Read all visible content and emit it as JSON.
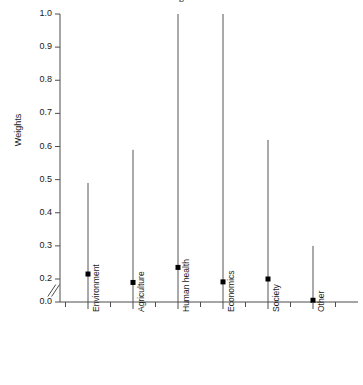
{
  "chart_data": {
    "type": "scatter",
    "title": "b",
    "xlabel": "",
    "ylabel": "Weights",
    "ylim": [
      0.0,
      1.0
    ],
    "grid": false,
    "legend": null,
    "axis_break": {
      "present": true,
      "symbol": "//",
      "between": [
        0.0,
        0.2
      ],
      "note": "double-slash break mark on y axis just above 0.0"
    },
    "yticks": [
      "0.0",
      "0.2",
      "0.3",
      "0.4",
      "0.5",
      "0.6",
      "0.7",
      "0.8",
      "0.9",
      "1.0"
    ],
    "ytick_values": [
      0.0,
      0.2,
      0.3,
      0.4,
      0.5,
      0.6,
      0.7,
      0.8,
      0.9,
      1.0
    ],
    "categories": [
      "Environment",
      "Agriculture",
      "Human health",
      "Economics",
      "Society",
      "Other"
    ],
    "series": [
      {
        "name": "Weight estimate",
        "marker": "filled-square",
        "color": "#000000",
        "values": [
          0.215,
          0.17,
          0.235,
          0.175,
          0.2,
          0.015
        ]
      },
      {
        "name": "Upper bound",
        "values": [
          0.49,
          0.59,
          1.0,
          1.0,
          0.62,
          0.3
        ]
      },
      {
        "name": "Lower bound",
        "values": [
          0.0,
          0.0,
          0.0,
          0.0,
          0.0,
          0.0
        ]
      }
    ],
    "points": [
      {
        "category": "Environment",
        "value": 0.215,
        "low": 0.0,
        "high": 0.49
      },
      {
        "category": "Agriculture",
        "value": 0.17,
        "low": 0.0,
        "high": 0.59
      },
      {
        "category": "Human health",
        "value": 0.235,
        "low": 0.0,
        "high": 1.0
      },
      {
        "category": "Economics",
        "value": 0.175,
        "low": 0.0,
        "high": 1.0
      },
      {
        "category": "Society",
        "value": 0.2,
        "low": 0.0,
        "high": 0.62
      },
      {
        "category": "Other",
        "value": 0.015,
        "low": 0.0,
        "high": 0.3
      }
    ],
    "colors": {
      "axis": "#4d4d4d",
      "whisker": "#555555",
      "marker": "#000000",
      "background": "#ffffff"
    }
  }
}
